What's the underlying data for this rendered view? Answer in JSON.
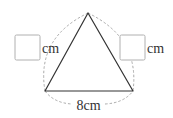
{
  "figure": {
    "type": "equilateral-triangle",
    "vertices": {
      "apex": [
        88,
        13
      ],
      "bottom_left": [
        45,
        91
      ],
      "bottom_right": [
        133,
        91
      ]
    },
    "labels": {
      "left_side_unit": "cm",
      "right_side_unit": "cm",
      "bottom_side": "8cm"
    },
    "answer_boxes": {
      "left": "",
      "right": ""
    },
    "colors": {
      "triangle_stroke": "#333333",
      "dashed_arc": "#a0a0a0",
      "box_border": "#b0b0b0",
      "text": "#333333"
    }
  }
}
